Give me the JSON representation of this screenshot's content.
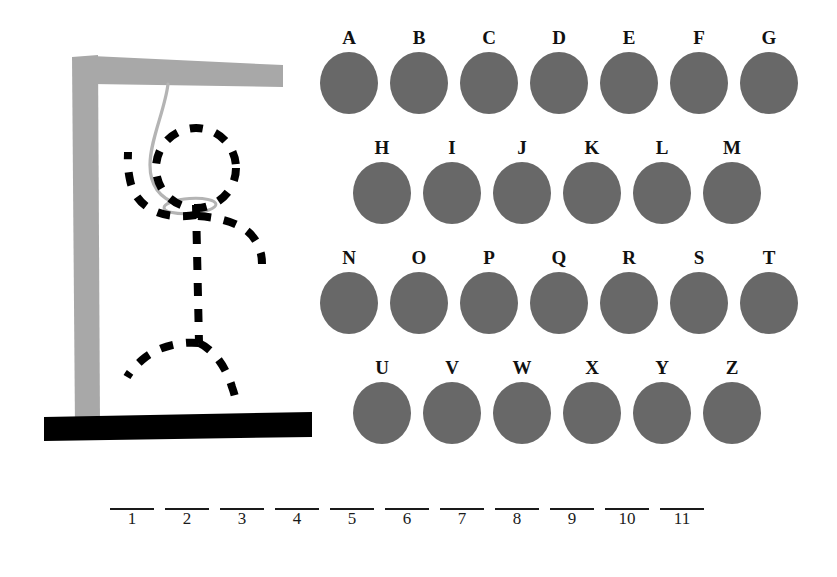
{
  "game": {
    "title": "Hangman",
    "wrong_guess_count": 6,
    "max_wrong_guesses": 6
  },
  "gallows": {
    "post_color": "#a8a8a8",
    "beam_color": "#a8a8a8",
    "ground_color": "#000000",
    "rope_color": "#b4b4b4",
    "figure_color": "#000000",
    "figure_style": "dashed",
    "parts": {
      "head": "head",
      "body": "body",
      "arms": "arms",
      "legs": "legs",
      "rope": "rope",
      "noose_loop": "noose-loop"
    }
  },
  "alphabet": {
    "button_color": "#686868",
    "rows": [
      {
        "name": "row-a",
        "keys": [
          "A",
          "B",
          "C",
          "D",
          "E",
          "F",
          "G"
        ]
      },
      {
        "name": "row-b",
        "keys": [
          "H",
          "I",
          "J",
          "K",
          "L",
          "M"
        ]
      },
      {
        "name": "row-c",
        "keys": [
          "N",
          "O",
          "P",
          "Q",
          "R",
          "S",
          "T"
        ]
      },
      {
        "name": "row-d",
        "keys": [
          "U",
          "V",
          "W",
          "X",
          "Y",
          "Z"
        ]
      }
    ]
  },
  "word": {
    "length": 11,
    "blanks": [
      {
        "number": "1",
        "letter": ""
      },
      {
        "number": "2",
        "letter": ""
      },
      {
        "number": "3",
        "letter": ""
      },
      {
        "number": "4",
        "letter": ""
      },
      {
        "number": "5",
        "letter": ""
      },
      {
        "number": "6",
        "letter": ""
      },
      {
        "number": "7",
        "letter": ""
      },
      {
        "number": "8",
        "letter": ""
      },
      {
        "number": "9",
        "letter": ""
      },
      {
        "number": "10",
        "letter": ""
      },
      {
        "number": "11",
        "letter": ""
      }
    ]
  }
}
